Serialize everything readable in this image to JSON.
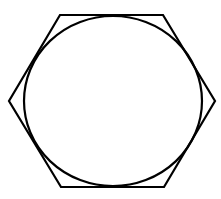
{
  "diagram": {
    "stroke_color": "#000000",
    "background": "#ffffff",
    "hexagon": {
      "points": "60,15 163,15 215,101 164,187 61,187 9,101"
    },
    "circle": {
      "cx": 113,
      "cy": 101,
      "rx": 89,
      "ry": 85
    }
  }
}
